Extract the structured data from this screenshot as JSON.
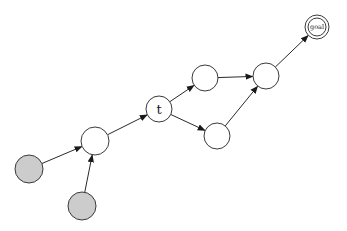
{
  "diagram": {
    "type": "directed-graph",
    "colors": {
      "stroke": "#3a3a3a",
      "filled_node": "#cccccc",
      "empty_node": "#ffffff",
      "edge": "#2a2a2a"
    },
    "nodes": [
      {
        "id": "s1",
        "label": "",
        "x": 29,
        "y": 169,
        "r": 14,
        "fill": "#cccccc",
        "double": false
      },
      {
        "id": "s2",
        "label": "",
        "x": 82,
        "y": 206,
        "r": 14,
        "fill": "#cccccc",
        "double": false
      },
      {
        "id": "a",
        "label": "",
        "x": 95,
        "y": 141,
        "r": 14,
        "fill": "#ffffff",
        "double": false
      },
      {
        "id": "t",
        "label": "t",
        "x": 159,
        "y": 109,
        "r": 13,
        "fill": "#ffffff",
        "double": false
      },
      {
        "id": "b",
        "label": "",
        "x": 205,
        "y": 78,
        "r": 13,
        "fill": "#ffffff",
        "double": false
      },
      {
        "id": "c",
        "label": "",
        "x": 217,
        "y": 136,
        "r": 13,
        "fill": "#ffffff",
        "double": false
      },
      {
        "id": "d",
        "label": "",
        "x": 266,
        "y": 76,
        "r": 13,
        "fill": "#ffffff",
        "double": false
      },
      {
        "id": "goal",
        "label": "goal",
        "x": 317,
        "y": 27,
        "r": 12,
        "fill": "#ffffff",
        "double": true
      }
    ],
    "edges": [
      {
        "from": "s1",
        "to": "a"
      },
      {
        "from": "s2",
        "to": "a"
      },
      {
        "from": "a",
        "to": "t"
      },
      {
        "from": "t",
        "to": "b"
      },
      {
        "from": "t",
        "to": "c"
      },
      {
        "from": "b",
        "to": "d"
      },
      {
        "from": "c",
        "to": "d"
      },
      {
        "from": "d",
        "to": "goal"
      }
    ]
  }
}
